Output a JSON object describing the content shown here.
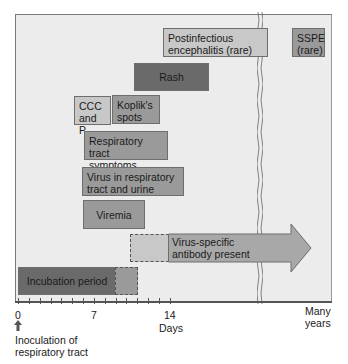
{
  "diagram": {
    "type": "timeline",
    "boxes": [
      {
        "id": "postinfectious",
        "label_line1": "Postinfectious",
        "label_line2": "encephalitis (rare)"
      },
      {
        "id": "sspe",
        "label_line1": "SSPE",
        "label_line2": "(rare)"
      },
      {
        "id": "rash",
        "label": "Rash"
      },
      {
        "id": "ccc",
        "label_line1": "CCC",
        "label_line2": "and P"
      },
      {
        "id": "koplik",
        "label_line1": "Koplik's",
        "label_line2": "spots"
      },
      {
        "id": "resp_symptoms",
        "label_line1": "Respiratory tract",
        "label_line2": "symptoms"
      },
      {
        "id": "virus_resp",
        "label_line1": "Virus in respiratory",
        "label_line2": "tract and urine"
      },
      {
        "id": "viremia",
        "label": "Viremia"
      },
      {
        "id": "antibody",
        "label_line1": "Virus-specific",
        "label_line2": "antibody present"
      },
      {
        "id": "incubation",
        "label": "Incubation period"
      }
    ],
    "axis": {
      "ticks": [
        "0",
        "7",
        "14"
      ],
      "xlabel": "Days",
      "far_label_line1": "Many",
      "far_label_line2": "years",
      "origin_note_line1": "Inoculation of",
      "origin_note_line2": "respiratory tract"
    },
    "colors": {
      "background": "#ececec",
      "dark": "#6a6a6a",
      "mid": "#9a9a9a",
      "light": "#c8c8c8"
    }
  }
}
